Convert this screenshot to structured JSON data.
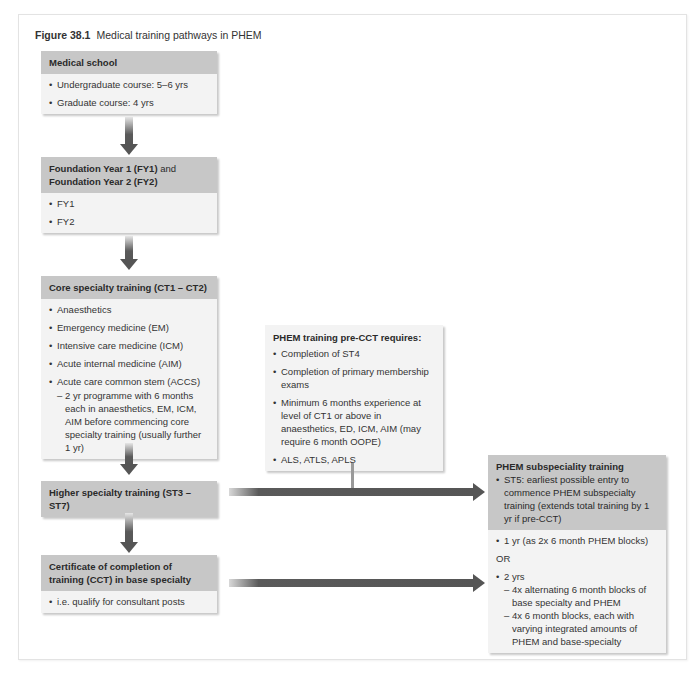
{
  "figure": {
    "number": "Figure 38.1",
    "title": "Medical training pathways in PHEM"
  },
  "boxes": {
    "medical_school": {
      "title": "Medical school",
      "items": [
        "Undergraduate course: 5–6 yrs",
        "Graduate course: 4 yrs"
      ]
    },
    "foundation": {
      "title_bold_1": "Foundation Year 1 (FY1)",
      "title_normal": " and",
      "title_bold_2": "Foundation Year 2 (FY2)",
      "items": [
        "FY1",
        "FY2"
      ]
    },
    "core": {
      "title": "Core specialty training (CT1 – CT2)",
      "items": [
        "Anaesthetics",
        "Emergency medicine (EM)",
        "Intensive care medicine (ICM)",
        "Acute internal medicine (AIM)",
        "Acute care common stem (ACCS)"
      ],
      "sub_item": "2 yr programme with 6 months each in anaesthetics, EM, ICM, AIM before commencing core specialty training (usually further 1 yr)"
    },
    "higher": {
      "title": "Higher specialty training (ST3 – ST7)"
    },
    "cct": {
      "title": "Certificate of completion of training (CCT) in base specialty",
      "items": [
        "i.e. qualify for consultant posts"
      ]
    },
    "pre_cct": {
      "title": "PHEM training pre-CCT requires:",
      "items": [
        "Completion of ST4",
        "Completion of primary membership exams",
        "Minimum 6 months experience at level of CT1 or above in anaesthetics, ED, ICM, AIM (may require 6 month OOPE)",
        "ALS, ATLS, APLS"
      ]
    },
    "subspeciality": {
      "title": "PHEM subspeciality training",
      "header_item": "ST5: earliest possible entry to commence PHEM subspecialty training (extends total training by 1 yr if pre-CCT)",
      "option_1": "1 yr (as 2x 6 month PHEM blocks)",
      "or_label": "OR",
      "option_2": "2 yrs",
      "option_2_subs": [
        "4x alternating 6 month blocks of base specialty and PHEM",
        "4x 6 month blocks, each with varying integrated amounts of PHEM and base-specialty"
      ]
    }
  },
  "colors": {
    "header_fill": "#c7c7c7",
    "body_fill": "#f3f3f3",
    "arrow": "#555555",
    "connector": "#999999",
    "frame": "#e3e3e3"
  }
}
